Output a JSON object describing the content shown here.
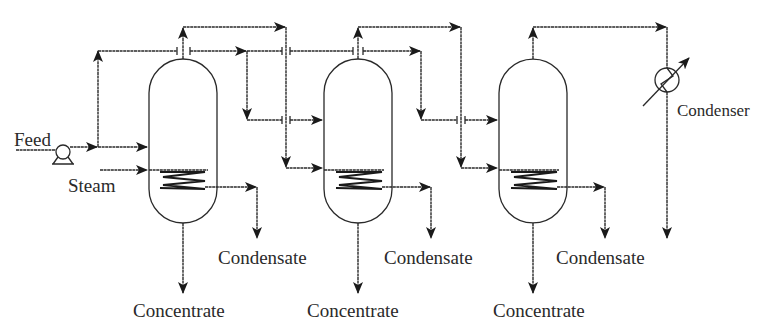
{
  "diagram": {
    "labels": {
      "feed": "Feed",
      "steam": "Steam",
      "condenser": "Condenser",
      "condensate_1": "Condensate",
      "condensate_2": "Condensate",
      "condensate_3": "Condensate",
      "concentrate_1": "Concentrate",
      "concentrate_2": "Concentrate",
      "concentrate_3": "Concentrate"
    },
    "nodes": [
      {
        "id": "pump",
        "type": "pump",
        "label": "",
        "x": 63,
        "y": 153
      },
      {
        "id": "effect-1",
        "type": "evaporator",
        "x": 183,
        "y": 140
      },
      {
        "id": "effect-2",
        "type": "evaporator",
        "x": 358,
        "y": 140
      },
      {
        "id": "effect-3",
        "type": "evaporator",
        "x": 533,
        "y": 140
      },
      {
        "id": "condenser",
        "type": "condenser",
        "label": "Condenser",
        "x": 667,
        "y": 80
      }
    ],
    "edges": [
      {
        "from": "feed",
        "to": "pump"
      },
      {
        "from": "pump",
        "to": "effect-1",
        "kind": "feed"
      },
      {
        "from": "pump",
        "to": "effect-2",
        "kind": "feed-split"
      },
      {
        "from": "pump",
        "to": "effect-3",
        "kind": "feed-split"
      },
      {
        "from": "steam",
        "to": "effect-1",
        "kind": "heating steam"
      },
      {
        "from": "effect-1",
        "to": "effect-2",
        "kind": "vapour"
      },
      {
        "from": "effect-2",
        "to": "effect-3",
        "kind": "vapour"
      },
      {
        "from": "effect-3",
        "to": "condenser",
        "kind": "vapour"
      },
      {
        "from": "effect-1",
        "to": "condensate-1",
        "kind": "condensate"
      },
      {
        "from": "effect-2",
        "to": "condensate-2",
        "kind": "condensate"
      },
      {
        "from": "effect-3",
        "to": "condensate-3",
        "kind": "condensate"
      },
      {
        "from": "effect-1",
        "to": "concentrate-1",
        "kind": "product"
      },
      {
        "from": "effect-2",
        "to": "concentrate-2",
        "kind": "product"
      },
      {
        "from": "effect-3",
        "to": "concentrate-3",
        "kind": "product"
      },
      {
        "from": "condenser",
        "to": "drain",
        "kind": "condensate"
      }
    ],
    "colors": {
      "line": "#2a2a2a",
      "background": "#ffffff"
    }
  }
}
